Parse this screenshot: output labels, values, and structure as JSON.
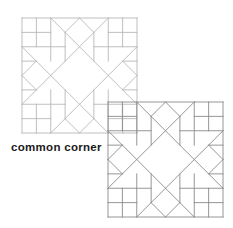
{
  "caption": "common corner",
  "blocks": [
    {
      "id": "block-1",
      "x": 22,
      "y": 18,
      "size": 115,
      "stroke": "#b8b8b8"
    },
    {
      "id": "block-2",
      "x": 108,
      "y": 102,
      "size": 115,
      "stroke": "#8a8a8a"
    }
  ],
  "pattern": {
    "units": 8,
    "description": "star quilt block with four-patch corners and on-point center square",
    "segments": [
      [
        0,
        0,
        8,
        0
      ],
      [
        8,
        0,
        8,
        8
      ],
      [
        8,
        8,
        0,
        8
      ],
      [
        0,
        8,
        0,
        0
      ],
      [
        2,
        0,
        8,
        6
      ],
      [
        6,
        0,
        0,
        6
      ],
      [
        0,
        2,
        6,
        8
      ],
      [
        8,
        2,
        2,
        8
      ],
      [
        4,
        0,
        3,
        1
      ],
      [
        4,
        0,
        5,
        1
      ],
      [
        0,
        4,
        1,
        3
      ],
      [
        0,
        4,
        1,
        5
      ],
      [
        8,
        4,
        7,
        3
      ],
      [
        8,
        4,
        7,
        5
      ],
      [
        4,
        8,
        3,
        7
      ],
      [
        4,
        8,
        5,
        7
      ],
      [
        0,
        1,
        2,
        1
      ],
      [
        0,
        2,
        3,
        2
      ],
      [
        1,
        0,
        1,
        2
      ],
      [
        2,
        0,
        2,
        3
      ],
      [
        3,
        1,
        3,
        3
      ],
      [
        0,
        3,
        1,
        3
      ],
      [
        8,
        1,
        6,
        1
      ],
      [
        8,
        2,
        5,
        2
      ],
      [
        7,
        0,
        7,
        2
      ],
      [
        6,
        0,
        6,
        3
      ],
      [
        5,
        1,
        5,
        3
      ],
      [
        8,
        3,
        7,
        3
      ],
      [
        0,
        7,
        2,
        7
      ],
      [
        0,
        6,
        3,
        6
      ],
      [
        1,
        8,
        1,
        6
      ],
      [
        2,
        8,
        2,
        5
      ],
      [
        3,
        7,
        3,
        5
      ],
      [
        0,
        5,
        1,
        5
      ],
      [
        8,
        7,
        6,
        7
      ],
      [
        8,
        6,
        5,
        6
      ],
      [
        7,
        8,
        7,
        6
      ],
      [
        6,
        8,
        6,
        5
      ],
      [
        5,
        7,
        5,
        5
      ],
      [
        8,
        5,
        7,
        5
      ]
    ]
  }
}
